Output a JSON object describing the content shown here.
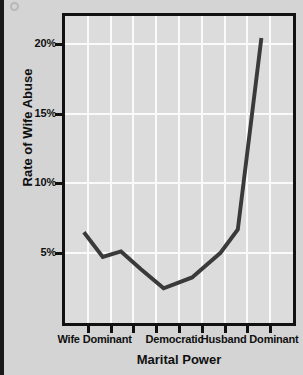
{
  "chart_data": {
    "type": "line",
    "title": "",
    "xlabel": "Marital Power",
    "ylabel": "Rate of Wife Abuse",
    "ylim": [
      0,
      22
    ],
    "xlim": [
      0,
      10
    ],
    "grid": true,
    "legend": null,
    "y_ticks": [
      {
        "label": "5%",
        "value": 5
      },
      {
        "label": "10%",
        "value": 10
      },
      {
        "label": "15%",
        "value": 15
      },
      {
        "label": "20%",
        "value": 20
      }
    ],
    "x_tick_count": 9,
    "x_category_labels": [
      {
        "label": "Wife Dominant",
        "position": 1.3
      },
      {
        "label": "Democratic",
        "position": 4.8
      },
      {
        "label": "Husband Dominant",
        "position": 8.1
      }
    ],
    "series": [
      {
        "name": "Rate of Wife Abuse",
        "color": "#3a3a3a",
        "x": [
          0.85,
          1.7,
          2.52,
          3.42,
          4.44,
          5.72,
          7.0,
          7.78,
          8.84
        ],
        "values": [
          6.2,
          4.4,
          4.8,
          3.5,
          2.1,
          2.9,
          4.7,
          6.4,
          20.4
        ]
      }
    ]
  }
}
